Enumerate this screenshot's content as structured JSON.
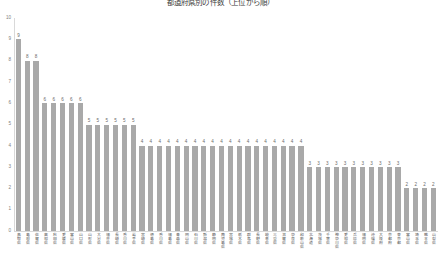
{
  "chart_data": {
    "type": "bar",
    "title": "都道府県別の件数（上位から順）",
    "xlabel": "",
    "ylabel": "",
    "ylim": [
      0,
      10
    ],
    "ytick_labels": [
      "10",
      "9",
      "8",
      "7",
      "6",
      "5",
      "4",
      "3",
      "2",
      "1",
      "0"
    ],
    "grid": false,
    "legend": null,
    "bar_color": "#a9a9a9",
    "value_label_color": "#6b6b6b",
    "axis_color": "#d9d9d9",
    "categories": [
      "鳥取県",
      "島根県",
      "佐賀県",
      "高知県",
      "秋田県",
      "愛媛県",
      "富山県",
      "山口県",
      "山形県",
      "大分県",
      "福井県",
      "長崎県",
      "香川県",
      "岩手県",
      "宮崎県",
      "徳島県",
      "香川県",
      "福島県",
      "青森県",
      "岡山県",
      "石川県",
      "新潟県",
      "静岡県",
      "鹿児島県",
      "宮城県",
      "栃木県",
      "群馬県",
      "長野県",
      "岐阜県",
      "三重県",
      "滋賀県",
      "奈良県",
      "和歌山県",
      "北海道",
      "茨城県",
      "千葉県",
      "神奈川県",
      "愛知県",
      "兵庫県",
      "福岡県",
      "沖縄県",
      "大阪府",
      "京都府",
      "東京都",
      "富山県",
      "埼玉県",
      "熊本県",
      "山梨県"
    ],
    "values": [
      9,
      8,
      8,
      6,
      6,
      6,
      6,
      6,
      5,
      5,
      5,
      5,
      5,
      5,
      4,
      4,
      4,
      4,
      4,
      4,
      4,
      4,
      4,
      4,
      4,
      4,
      4,
      4,
      4,
      4,
      4,
      4,
      4,
      3,
      3,
      3,
      3,
      3,
      3,
      3,
      3,
      3,
      3,
      3,
      2,
      2,
      2,
      2
    ]
  }
}
